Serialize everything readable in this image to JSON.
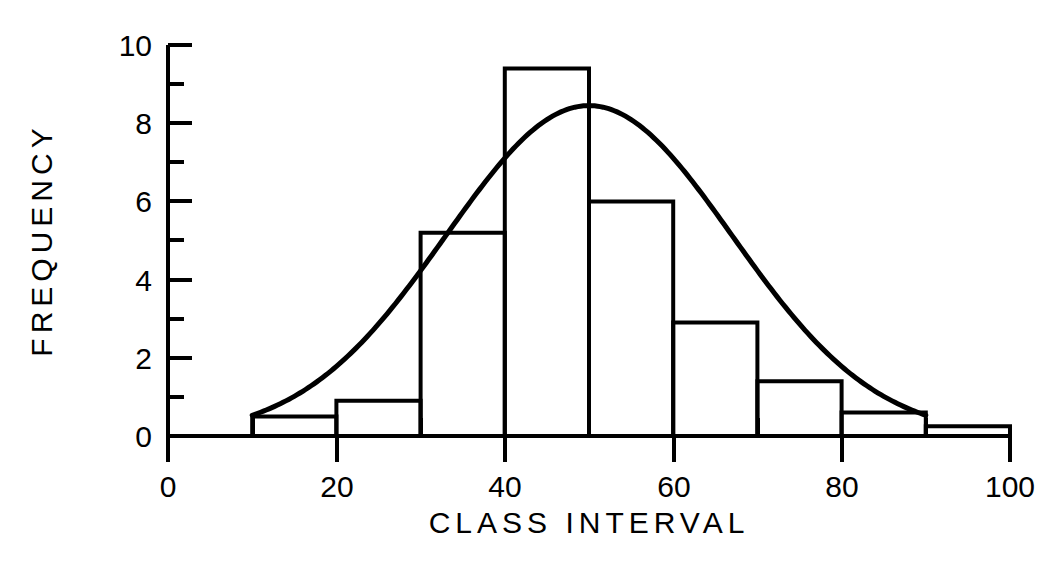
{
  "chart_data": {
    "type": "bar",
    "title": "",
    "subtitle": "",
    "xlabel": "CLASS INTERVAL",
    "ylabel": "FREQUENCY",
    "xlim": [
      0,
      100
    ],
    "ylim": [
      0,
      10
    ],
    "grid": false,
    "legend": null,
    "legend_position": "none",
    "x_ticks_major": [
      0,
      20,
      40,
      60,
      80,
      100
    ],
    "x_ticks_minor": [
      10,
      30,
      50,
      70,
      90
    ],
    "x_tick_labels": [
      "0",
      "20",
      "40",
      "60",
      "80",
      "100"
    ],
    "y_ticks_major": [
      0,
      2,
      4,
      6,
      8,
      10
    ],
    "y_ticks_minor": [
      1,
      3,
      5,
      7,
      9
    ],
    "y_tick_labels": [
      "0",
      "2",
      "4",
      "6",
      "8",
      "10"
    ],
    "bin_width": 10,
    "bin_edges": [
      0,
      10,
      20,
      30,
      40,
      50,
      60,
      70,
      80,
      90,
      100
    ],
    "categories": [
      "0-10",
      "10-20",
      "20-30",
      "30-40",
      "40-50",
      "50-60",
      "60-70",
      "70-80",
      "80-90",
      "90-100"
    ],
    "bin_centers": [
      5,
      15,
      25,
      35,
      45,
      55,
      65,
      75,
      85,
      95
    ],
    "values": [
      0,
      0.5,
      0.9,
      5.2,
      9.4,
      6.0,
      2.9,
      1.4,
      0.6,
      0.25
    ],
    "series": [
      {
        "name": "Histogram",
        "kind": "bar",
        "values": [
          0,
          0.5,
          0.9,
          5.2,
          9.4,
          6.0,
          2.9,
          1.4,
          0.6,
          0.25
        ]
      },
      {
        "name": "Normal curve",
        "kind": "line",
        "mean": 50,
        "sigma": 17,
        "peak": 8.45,
        "x_start": 10,
        "x_end": 90
      }
    ],
    "colors": {
      "axis": "#000000",
      "bar_edge": "#000000",
      "bar_fill": "none",
      "curve": "#000000",
      "background": "#ffffff"
    }
  },
  "axes": {
    "x_label_text": "CLASS INTERVAL",
    "y_label_text": "FREQUENCY"
  },
  "tick_text": {
    "x": [
      "0",
      "20",
      "40",
      "60",
      "80",
      "100"
    ],
    "y": [
      "0",
      "2",
      "4",
      "6",
      "8",
      "10"
    ]
  }
}
